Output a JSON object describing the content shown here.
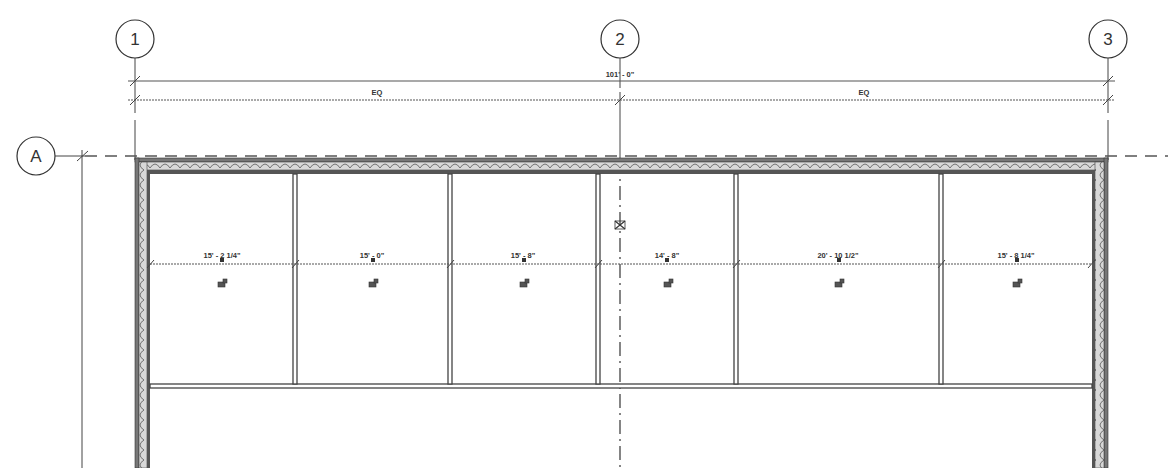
{
  "drawing": {
    "type": "architectural-floor-plan",
    "grid_lines": {
      "vertical": [
        {
          "label": "1",
          "x": 135
        },
        {
          "label": "2",
          "x": 620
        },
        {
          "label": "3",
          "x": 1108
        }
      ],
      "horizontal": [
        {
          "label": "A",
          "y": 156
        }
      ]
    },
    "overall_dimension": {
      "text": "101' - 0\"",
      "from_grid": "1",
      "to_grid": "3"
    },
    "eq_dimensions": [
      {
        "text": "EQ",
        "from_grid": "1",
        "to_grid": "2"
      },
      {
        "text": "EQ",
        "from_grid": "2",
        "to_grid": "3"
      }
    ],
    "rooms": [
      {
        "dimension": "15' - 2 1/4\"",
        "x1": 150,
        "x2": 295
      },
      {
        "dimension": "15' - 0\"",
        "x1": 295,
        "x2": 450
      },
      {
        "dimension": "15' - 8\"",
        "x1": 450,
        "x2": 598
      },
      {
        "dimension": "14' - 8\"",
        "x1": 598,
        "x2": 736
      },
      {
        "dimension": "20' - 10 1/2\"",
        "x1": 736,
        "x2": 941
      },
      {
        "dimension": "15' - 8 1/4\"",
        "x1": 941,
        "x2": 1092
      }
    ],
    "colors": {
      "line": "#444444",
      "wall_fill": "#9a9a9a",
      "background": "#ffffff"
    }
  }
}
